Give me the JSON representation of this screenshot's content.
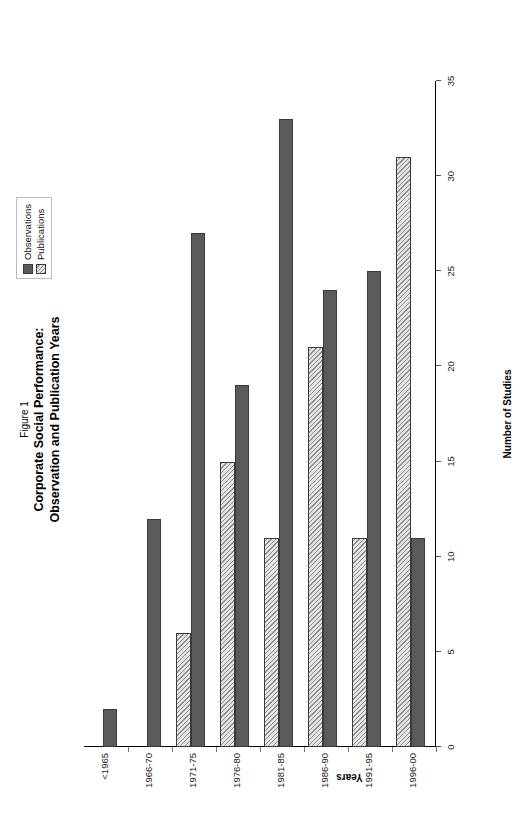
{
  "figure": {
    "number_label": "Figure 1",
    "title_line1": "Corporate Social Performance:",
    "title_line2": "Observation and Publication Years"
  },
  "legend": {
    "position": "top-right",
    "items": [
      {
        "label": "Observations",
        "swatch": "solid-dark-gray",
        "color": "#5a5a5a"
      },
      {
        "label": "Publications",
        "swatch": "diagonal-hatch",
        "color": "#d8d8d8"
      }
    ]
  },
  "axes": {
    "value_axis_label": "Number of Studies",
    "category_axis_label": "Years",
    "value_ticks": [
      "0",
      "5",
      "10",
      "15",
      "20",
      "25",
      "30",
      "35"
    ],
    "value_min": 0,
    "value_max": 35
  },
  "chart_data": {
    "type": "bar",
    "orientation": "horizontal",
    "title": "Corporate Social Performance: Observation and Publication Years",
    "subtitle": "Figure 1",
    "xlabel": "Years",
    "ylabel": "Number of Studies",
    "ylim": [
      0,
      35
    ],
    "grid": false,
    "legend_position": "top-right",
    "categories": [
      "<1965",
      "1966-70",
      "1971-75",
      "1976-80",
      "1981-85",
      "1986-90",
      "1991-95",
      "1996-00"
    ],
    "series": [
      {
        "name": "Observations",
        "values": [
          2,
          12,
          27,
          19,
          33,
          24,
          25,
          11
        ]
      },
      {
        "name": "Publications",
        "values": [
          0,
          0,
          6,
          15,
          11,
          21,
          11,
          31
        ]
      }
    ]
  }
}
